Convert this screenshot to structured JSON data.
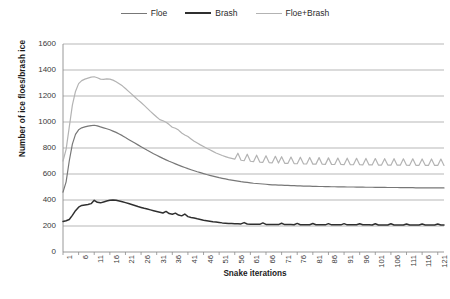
{
  "legend": {
    "position": "top-center",
    "items": [
      {
        "label": "Floe",
        "color": "#777777",
        "width": 1.6
      },
      {
        "label": "Brash",
        "color": "#2f2f2f",
        "width": 2.0
      },
      {
        "label": "Floe+Brash",
        "color": "#b3b3b3",
        "width": 1.6
      }
    ]
  },
  "axes": {
    "ylabel": "Number of ice floes/brash ice",
    "xlabel": "Snake iterations",
    "yticks": [
      0,
      200,
      400,
      600,
      800,
      1000,
      1200,
      1400,
      1600
    ],
    "xticks": [
      1,
      6,
      11,
      16,
      21,
      26,
      31,
      36,
      41,
      46,
      51,
      56,
      61,
      66,
      71,
      76,
      81,
      86,
      91,
      96,
      101,
      106,
      111,
      116,
      121
    ]
  },
  "style": {
    "gridline_color": "#9a9a9a",
    "axis_color": "#8c8c8c",
    "plot_background": "#ffffff"
  },
  "chart_data": {
    "type": "line",
    "title": "",
    "xlabel": "Snake iterations",
    "ylabel": "Number of ice floes/brash ice",
    "xlim": [
      1,
      123
    ],
    "ylim": [
      0,
      1600
    ],
    "grid": true,
    "legend_position": "top-center",
    "x": [
      1,
      2,
      3,
      4,
      5,
      6,
      7,
      8,
      9,
      10,
      11,
      12,
      13,
      14,
      15,
      16,
      17,
      18,
      19,
      20,
      21,
      22,
      23,
      24,
      25,
      26,
      27,
      28,
      29,
      30,
      31,
      32,
      33,
      34,
      35,
      36,
      37,
      38,
      39,
      40,
      41,
      42,
      43,
      44,
      45,
      46,
      47,
      48,
      49,
      50,
      51,
      52,
      53,
      54,
      55,
      56,
      57,
      58,
      59,
      60,
      61,
      62,
      63,
      64,
      65,
      66,
      67,
      68,
      69,
      70,
      71,
      72,
      73,
      74,
      75,
      76,
      77,
      78,
      79,
      80,
      81,
      82,
      83,
      84,
      85,
      86,
      87,
      88,
      89,
      90,
      91,
      92,
      93,
      94,
      95,
      96,
      97,
      98,
      99,
      100,
      101,
      102,
      103,
      104,
      105,
      106,
      107,
      108,
      109,
      110,
      111,
      112,
      113,
      114,
      115,
      116,
      117,
      118,
      119,
      120,
      121,
      122,
      123
    ],
    "series": [
      {
        "name": "Floe",
        "color": "#777777",
        "values": [
          460,
          540,
          700,
          830,
          905,
          940,
          955,
          962,
          968,
          972,
          975,
          970,
          962,
          955,
          948,
          940,
          930,
          920,
          908,
          895,
          880,
          866,
          852,
          838,
          824,
          810,
          796,
          782,
          769,
          756,
          744,
          732,
          720,
          709,
          698,
          688,
          678,
          668,
          659,
          650,
          641,
          633,
          625,
          617,
          610,
          603,
          596,
          590,
          584,
          578,
          572,
          567,
          562,
          557,
          553,
          549,
          545,
          541,
          538,
          535,
          532,
          529,
          527,
          525,
          523,
          521,
          519,
          517,
          516,
          515,
          514,
          513,
          512,
          511,
          510,
          509,
          508,
          507,
          507,
          506,
          505,
          505,
          504,
          504,
          503,
          503,
          502,
          502,
          501,
          501,
          501,
          500,
          500,
          500,
          499,
          499,
          499,
          498,
          498,
          498,
          497,
          497,
          497,
          497,
          496,
          496,
          496,
          496,
          495,
          495,
          495,
          495,
          495,
          494,
          494,
          494,
          494,
          494,
          493,
          493,
          493,
          493,
          493
        ]
      },
      {
        "name": "Brash",
        "color": "#2f2f2f",
        "values": [
          235,
          240,
          250,
          282,
          318,
          345,
          358,
          362,
          365,
          372,
          398,
          382,
          378,
          385,
          392,
          398,
          400,
          398,
          393,
          387,
          380,
          373,
          366,
          358,
          350,
          343,
          336,
          330,
          324,
          318,
          312,
          306,
          300,
          312,
          296,
          290,
          299,
          284,
          278,
          292,
          272,
          266,
          261,
          255,
          250,
          245,
          241,
          237,
          233,
          230,
          227,
          224,
          222,
          220,
          219,
          218,
          217,
          216,
          226,
          215,
          214,
          214,
          213,
          213,
          224,
          212,
          212,
          212,
          211,
          211,
          221,
          211,
          211,
          211,
          210,
          220,
          210,
          210,
          210,
          210,
          219,
          210,
          210,
          210,
          209,
          218,
          209,
          209,
          209,
          209,
          218,
          209,
          209,
          209,
          209,
          217,
          209,
          209,
          209,
          208,
          217,
          208,
          208,
          208,
          208,
          217,
          208,
          208,
          208,
          208,
          216,
          208,
          208,
          208,
          208,
          216,
          208,
          208,
          208,
          208,
          216,
          208,
          208
        ]
      },
      {
        "name": "Floe+Brash",
        "color": "#b3b3b3",
        "values": [
          700,
          790,
          960,
          1130,
          1235,
          1295,
          1318,
          1330,
          1338,
          1345,
          1348,
          1340,
          1330,
          1328,
          1332,
          1330,
          1322,
          1310,
          1295,
          1278,
          1258,
          1236,
          1214,
          1192,
          1170,
          1150,
          1128,
          1105,
          1082,
          1060,
          1038,
          1018,
          1010,
          998,
          980,
          960,
          952,
          938,
          915,
          900,
          888,
          870,
          852,
          838,
          824,
          812,
          798,
          786,
          774,
          762,
          752,
          742,
          734,
          726,
          720,
          714,
          760,
          706,
          702,
          752,
          698,
          695,
          745,
          692,
          690,
          740,
          688,
          686,
          736,
          684,
          733,
          682,
          681,
          730,
          680,
          679,
          729,
          678,
          677,
          727,
          676,
          676,
          726,
          675,
          674,
          724,
          674,
          673,
          723,
          673,
          672,
          722,
          672,
          671,
          721,
          671,
          670,
          720,
          670,
          670,
          719,
          669,
          669,
          718,
          669,
          668,
          718,
          668,
          668,
          717,
          668,
          667,
          717,
          667,
          667,
          716,
          667,
          666,
          716,
          666,
          666,
          715,
          666
        ]
      }
    ]
  }
}
